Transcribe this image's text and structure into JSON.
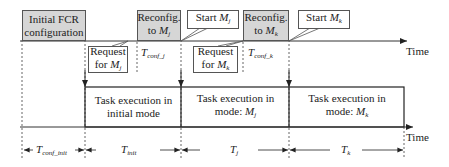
{
  "diagram": {
    "top_axis_label": "Time",
    "bottom_axis_label": "Time",
    "top_boxes": [
      {
        "line1": "Initial FCR",
        "line2": "configuration"
      },
      {
        "line1": "Reconfig.",
        "line2_prefix": "to ",
        "line2_var": "M",
        "line2_sub": "j"
      },
      {
        "line1": "Reconfig.",
        "line2_prefix": "to ",
        "line2_var": "M",
        "line2_sub": "k"
      }
    ],
    "start_callouts": [
      {
        "prefix": "Start ",
        "var": "M",
        "sub": "j"
      },
      {
        "prefix": "Start ",
        "var": "M",
        "sub": "k"
      }
    ],
    "request_callouts": [
      {
        "line1": "Request",
        "line2_prefix": "for ",
        "var": "M",
        "sub": "j"
      },
      {
        "line1": "Request",
        "line2_prefix": "for ",
        "var": "M",
        "sub": "k"
      }
    ],
    "conf_labels": [
      {
        "var": "T",
        "sub": "conf_j"
      },
      {
        "var": "T",
        "sub": "conf_k"
      }
    ],
    "task_boxes": [
      {
        "line1": "Task execution in",
        "line2": "initial mode"
      },
      {
        "line1": "Task execution in",
        "line2_prefix": "mode: ",
        "var": "M",
        "sub": "j"
      },
      {
        "line1": "Task execution in",
        "line2_prefix": "mode: ",
        "var": "M",
        "sub": "k"
      }
    ],
    "durations": [
      {
        "var": "T",
        "sub": "conf_init"
      },
      {
        "var": "T",
        "sub": "init"
      },
      {
        "var": "T",
        "sub": "j"
      },
      {
        "var": "T",
        "sub": "k"
      }
    ]
  },
  "colors": {
    "reconfig_fill": "#d6d6d6",
    "line": "#333333"
  }
}
